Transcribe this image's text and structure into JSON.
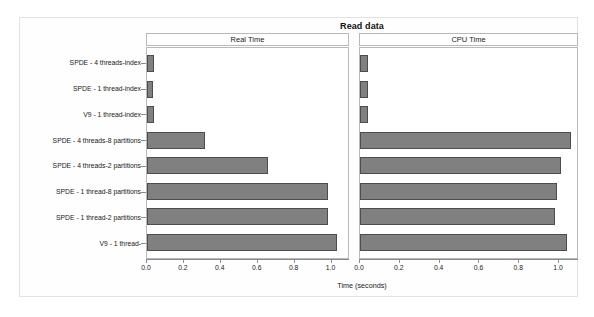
{
  "chart_data": {
    "type": "bar",
    "orientation": "horizontal",
    "title": "Read data",
    "xlabel": "Time (seconds)",
    "ylabel": "",
    "grid": false,
    "legend": "none",
    "panels": [
      {
        "name": "Real Time",
        "xlim": [
          0.0,
          1.1
        ],
        "xticks": [
          0.0,
          0.2,
          0.4,
          0.6,
          0.8,
          1.0
        ],
        "xticklabels": [
          "0.0",
          "0.2",
          "0.4",
          "0.6",
          "0.8",
          "1.0"
        ],
        "values": [
          0.04,
          0.035,
          0.04,
          0.32,
          0.66,
          0.99,
          0.99,
          1.04
        ]
      },
      {
        "name": "CPU Time",
        "xlim": [
          0.0,
          1.1
        ],
        "xticks": [
          0.0,
          0.2,
          0.4,
          0.6,
          0.8,
          1.0
        ],
        "xticklabels": [
          "0.0",
          "0.2",
          "0.4",
          "0.6",
          "0.8",
          "1.0"
        ],
        "values": [
          0.04,
          0.04,
          0.04,
          1.07,
          1.02,
          1.0,
          0.99,
          1.05
        ]
      }
    ],
    "categories": [
      "SPDE - 4 threads-index",
      "SPDE - 1 thread-index",
      "V9 - 1 thread-index",
      "SPDE - 4 threads-8 partitions",
      "SPDE - 4 threads-2 partitions",
      "SPDE - 1 thread-8 partitions",
      "SPDE - 1 thread-2 partitions",
      "V9 - 1 thread-"
    ],
    "colors": {
      "bar_fill": "#808080",
      "bar_edge": "#4d4d4d",
      "axis": "#8a8a8a",
      "frame": "#e2e2e2",
      "panel_border": "#b9b9b9",
      "background": "#ffffff",
      "text": "#1a1a1a"
    }
  }
}
